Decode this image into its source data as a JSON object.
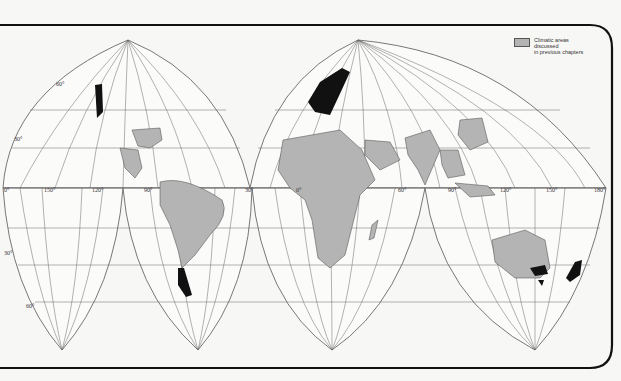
{
  "legend": {
    "swatch_color": "#b4b4b4",
    "label_line1": "Climatic areas discussed",
    "label_line2": "in previous chapters"
  },
  "colors": {
    "background": "#f7f7f5",
    "frame": "#111111",
    "graticule": "#555555",
    "land_outline": "#444444",
    "discussed_area": "#b4b4b4",
    "highlight_area": "#111111"
  },
  "map": {
    "projection": "Interrupted homolosine",
    "longitude_labels": [
      "150°",
      "120°",
      "90°",
      "30°",
      "0°",
      "60°",
      "90°",
      "120°",
      "150°",
      "180°"
    ],
    "latitude_labels": [
      "60°",
      "30°",
      "0°",
      "30°",
      "60°"
    ],
    "highlighted_regions": [
      "Pacific Northwest coast",
      "Western Europe",
      "Southern Chile",
      "Southeast Australia",
      "Tasmania",
      "New Zealand"
    ]
  }
}
